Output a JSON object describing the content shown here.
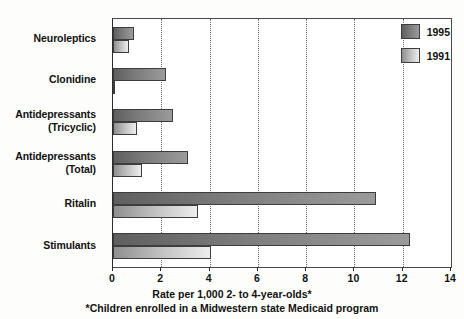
{
  "chart_data": {
    "type": "bar",
    "orientation": "horizontal",
    "title": "",
    "xlabel": "Rate per 1,000 2- to 4-year-olds*",
    "ylabel": "",
    "footnote": "*Children enrolled in a Midwestern state Medicaid program",
    "categories": [
      "Neuroleptics",
      "Clonidine",
      "Antidepressants (Tricyclic)",
      "Antidepressants (Total)",
      "Ritalin",
      "Stimulants"
    ],
    "category_lines": [
      [
        "Neuroleptics"
      ],
      [
        "Clonidine"
      ],
      [
        "Antidepressants",
        "(Tricyclic)"
      ],
      [
        "Antidepressants",
        "(Total)"
      ],
      [
        "Ritalin"
      ],
      [
        "Stimulants"
      ]
    ],
    "series": [
      {
        "name": "1995",
        "color": "#7d7d7d",
        "values": [
          0.85,
          2.2,
          2.5,
          3.1,
          10.9,
          12.3
        ]
      },
      {
        "name": "1991",
        "color": "#c6c6c6",
        "values": [
          0.65,
          0.1,
          1.0,
          1.2,
          3.5,
          4.05
        ]
      }
    ],
    "xlim": [
      0,
      14
    ],
    "xticks": [
      0,
      2,
      4,
      6,
      8,
      10,
      12,
      14
    ],
    "xtick_labels": [
      "0",
      "2",
      "4",
      "6",
      "8",
      "10",
      "12",
      "14"
    ],
    "grid": true,
    "gridline_values": [
      2,
      4,
      6,
      8,
      10,
      12
    ],
    "legend_position": "top-right"
  }
}
